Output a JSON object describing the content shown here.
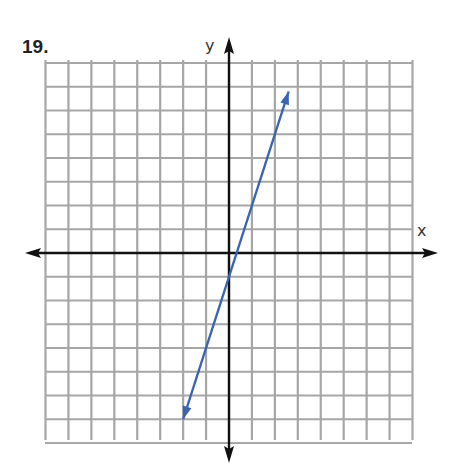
{
  "problem": {
    "number": "19."
  },
  "colors": {
    "grid": "#a6a6a6",
    "axis": "#111111",
    "line": "#3a64b0"
  },
  "chart_data": {
    "type": "line",
    "title": "19.",
    "xlabel": "x",
    "ylabel": "y",
    "xlim": [
      -8,
      8
    ],
    "ylim": [
      -8,
      8
    ],
    "grid": true,
    "grid_step": 1,
    "tick_labels": false,
    "legend": null,
    "series": [
      {
        "name": "line",
        "equation": "y = 3x - 1",
        "slope": 3,
        "intercept": -1,
        "x": [
          -2,
          2.6
        ],
        "y": [
          -7,
          6.8
        ],
        "arrows": "both ends"
      }
    ]
  }
}
